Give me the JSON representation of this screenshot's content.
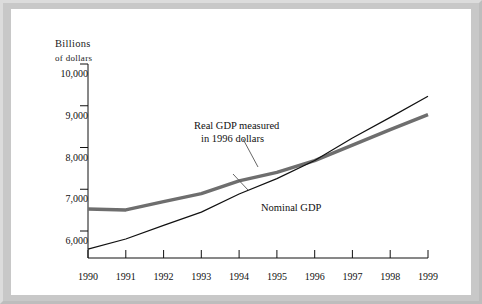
{
  "figure": {
    "background_color": "#c8c8c8",
    "plate_color": "#ffffff"
  },
  "chart_data": {
    "type": "line",
    "title": "",
    "subtitle": "",
    "xlabel": "",
    "ylabel": "Billions of dollars",
    "ylabel_line1": "Billions",
    "ylabel_line2": "of dollars",
    "x": [
      1990,
      1991,
      1992,
      1993,
      1994,
      1995,
      1996,
      1997,
      1998,
      1999
    ],
    "categories": [
      "1990",
      "1991",
      "1992",
      "1993",
      "1994",
      "1995",
      "1996",
      "1997",
      "1998",
      "1999"
    ],
    "xlim": [
      1990,
      1999
    ],
    "ylim": [
      5600,
      10000
    ],
    "yticks": [
      6000,
      7000,
      8000,
      9000,
      10000
    ],
    "ytick_labels": [
      "6,000",
      "7,000",
      "8,000",
      "9,000",
      "10,000"
    ],
    "xticks": [
      1990,
      1991,
      1992,
      1993,
      1994,
      1995,
      1996,
      1997,
      1998,
      1999
    ],
    "xtick_labels": [
      "1990",
      "1991",
      "1992",
      "1993",
      "1994",
      "1995",
      "1996",
      "1997",
      "1998",
      "1999"
    ],
    "grid": false,
    "legend_position": "inline-annotations",
    "series": [
      {
        "name": "Real GDP measured in 1996 dollars",
        "color": "#6e6e6e",
        "line_width": 3.4,
        "values": [
          6710,
          6690,
          6880,
          7060,
          7350,
          7540,
          7810,
          8160,
          8510,
          8850
        ]
      },
      {
        "name": "Nominal GDP",
        "color": "#111111",
        "line_width": 1.2,
        "values": [
          5800,
          6030,
          6340,
          6640,
          7050,
          7400,
          7810,
          8320,
          8790,
          9270
        ]
      }
    ],
    "annotations": [
      {
        "text_line1": "Real GDP measured",
        "text_line2": "in 1996 dollars",
        "target_series": "Real GDP measured in 1996 dollars",
        "leader": true
      },
      {
        "text_line1": "Nominal GDP",
        "text_line2": "",
        "target_series": "Nominal GDP",
        "leader": true
      }
    ]
  }
}
